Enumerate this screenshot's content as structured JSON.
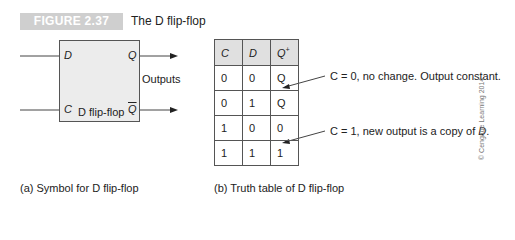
{
  "figure": {
    "badge": "FIGURE 2.37",
    "title": "The D flip-flop"
  },
  "symbol": {
    "input_d": "D",
    "input_c": "C",
    "output_q": "Q",
    "output_qbar": "Q",
    "box_label": "D flip-flop",
    "outputs_label": "Outputs",
    "caption": "(a) Symbol for D flip-flop"
  },
  "truth_table": {
    "headers": [
      "C",
      "D",
      "Q",
      "+"
    ],
    "rows": [
      [
        "0",
        "0",
        "Q"
      ],
      [
        "0",
        "1",
        "Q"
      ],
      [
        "1",
        "0",
        "0"
      ],
      [
        "1",
        "1",
        "1"
      ]
    ],
    "caption": "(b) Truth table of D flip-flop"
  },
  "annotations": {
    "note1": "C = 0, no change. Output constant.",
    "note2_prefix": "C = 1, new output is a copy of ",
    "note2_var": "D",
    "note2_suffix": "."
  },
  "copyright": "© Cengage Learning 2014"
}
